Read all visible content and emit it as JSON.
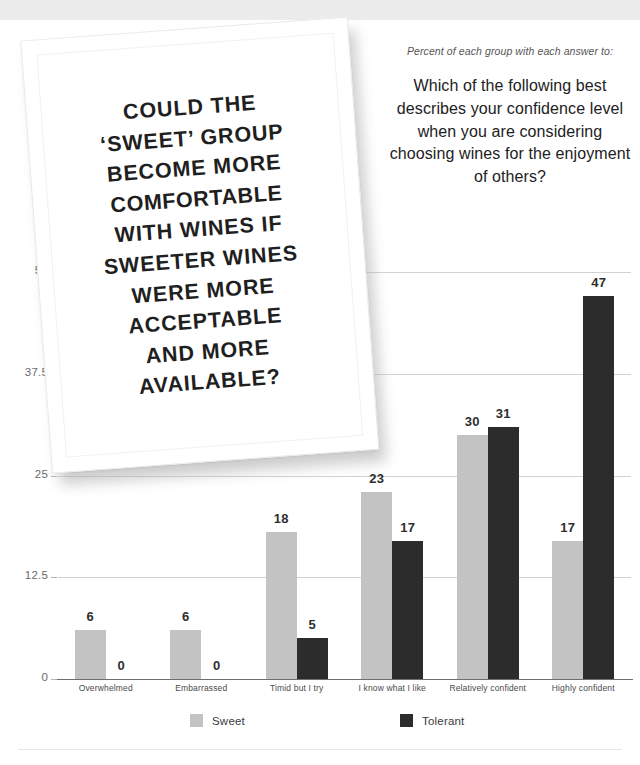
{
  "header": {
    "title": "CONFIDENCE CHOOSING WINE"
  },
  "question": {
    "kicker": "Percent of each group with each answer to:",
    "text": "Which of the following best describes your confidence level when you are considering choosing wines for the enjoyment of others?"
  },
  "pull_quote": {
    "lines": [
      {
        "text": "COULD THE",
        "bold": false
      },
      {
        "text": "‘SWEET’ GROUP",
        "bold": false
      },
      {
        "text": "BECOME MORE",
        "bold": false
      },
      {
        "text": "COMFORTABLE",
        "bold": true
      },
      {
        "text": "WITH WINES IF",
        "bold": false
      },
      {
        "text": "SWEETER WINES",
        "bold": false
      },
      {
        "text": "WERE MORE",
        "bold": false
      },
      {
        "text": "ACCEPTABLE",
        "bold": false
      },
      {
        "text": "AND MORE",
        "bold": false
      },
      {
        "text": "AVAILABLE?",
        "bold": false
      }
    ],
    "full_text": "COULD THE ‘SWEET’ GROUP BECOME MORE COMFORTABLE WITH WINES IF SWEETER WINES WERE MORE ACCEPTABLE AND MORE AVAILABLE?"
  },
  "colors": {
    "sweet": "#c3c3c3",
    "tolerant": "#2c2c2c",
    "title_band": "#ececec",
    "gridline": "#d2d2d2",
    "axis": "#6e6e6e"
  },
  "chart_data": {
    "type": "bar",
    "title": "CONFIDENCE CHOOSING WINE",
    "subtitle": "Percent of each group with each answer to: Which of the following best describes your confidence level when you are considering choosing wines for the enjoyment of others?",
    "xlabel": "",
    "ylabel": "",
    "ylim": [
      0,
      50
    ],
    "yticks": [
      "0",
      "12.5",
      "25",
      "37.5",
      "50"
    ],
    "ytick_values": [
      0,
      12.5,
      25,
      37.5,
      50
    ],
    "grid": true,
    "legend_position": "bottom",
    "categories": [
      "Overwhelmed",
      "Embarrassed",
      "Timid but I try",
      "I know what I like",
      "Relatively confident",
      "Highly confident"
    ],
    "series": [
      {
        "name": "Sweet",
        "color": "#c3c3c3",
        "values": [
          6,
          6,
          18,
          23,
          30,
          17
        ]
      },
      {
        "name": "Tolerant",
        "color": "#2c2c2c",
        "values": [
          0,
          0,
          5,
          17,
          31,
          47
        ]
      }
    ]
  }
}
